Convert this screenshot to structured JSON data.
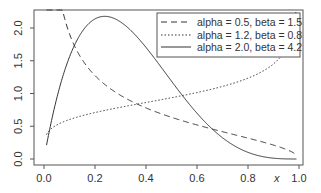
{
  "chart_data": {
    "type": "line",
    "title": "",
    "xlabel": "x",
    "ylabel": "",
    "xlim": [
      0,
      1
    ],
    "ylim": [
      0,
      2.2
    ],
    "grid": false,
    "legend_position": "top-right",
    "x_ticks": [
      "0.0",
      "0.2",
      "0.4",
      "0.6",
      "0.8",
      "1.0"
    ],
    "y_ticks": [
      "0.0",
      "0.5",
      "1.0",
      "1.5",
      "2.0"
    ],
    "series": [
      {
        "name": "alpha = 0.5, beta = 1.5",
        "alpha": 0.5,
        "beta": 1.5,
        "line_style": "dashed"
      },
      {
        "name": "alpha = 1.2, beta = 0.8",
        "alpha": 1.2,
        "beta": 0.8,
        "line_style": "dotted"
      },
      {
        "name": "alpha = 2.0, beta = 4.2",
        "alpha": 2.0,
        "beta": 4.2,
        "line_style": "solid"
      }
    ],
    "x_range_drawn": [
      0.01,
      0.99
    ]
  },
  "colors": {
    "line": "#333333",
    "frame": "#555555"
  }
}
